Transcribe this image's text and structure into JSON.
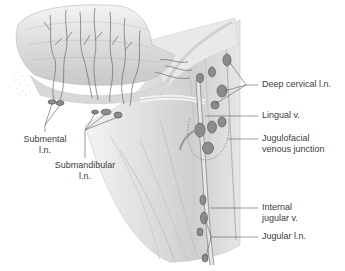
{
  "figure": {
    "type": "anatomical-illustration",
    "colors": {
      "background": "#ffffff",
      "tissue_light": "#ececec",
      "tissue_mid": "#d4d4d4",
      "tissue_dark": "#b5b5b5",
      "vessel": "#6a6a6a",
      "node": "#8c8c8c",
      "node_outline": "#4a4a4a",
      "leader_line": "#5a5a5a",
      "label_text": "#3c3c3c"
    }
  },
  "labels": {
    "deep_cervical": "Deep cervical l.n.",
    "lingual_v": "Lingual v.",
    "jugulofacial_1": "Jugulofacial",
    "jugulofacial_2": "venous junction",
    "internal_jugular_1": "Internal",
    "internal_jugular_2": "jugular v.",
    "jugular_ln": "Jugular l.n.",
    "submental_1": "Submental",
    "submental_2": "l.n.",
    "submandibular_1": "Submandibular",
    "submandibular_2": "l.n."
  }
}
